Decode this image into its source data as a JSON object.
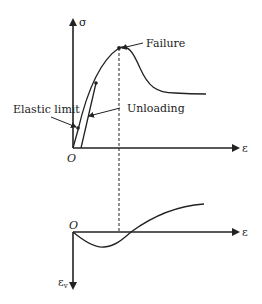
{
  "diagram": {
    "upper_plot": {
      "y_axis_label": "σ",
      "x_axis_label": "ε",
      "origin_label": "O",
      "annotations": {
        "elastic_limit": "Elastic limit",
        "unloading": "Unloading",
        "failure": "Failure"
      }
    },
    "lower_plot": {
      "y_axis_label": "ε",
      "y_axis_subscript": "v",
      "x_axis_label": "ε",
      "origin_label": "O"
    },
    "colors": {
      "line": "#222222",
      "background": "#ffffff"
    }
  }
}
